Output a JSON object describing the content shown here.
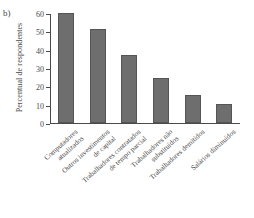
{
  "figure": {
    "panel_label": "b)"
  },
  "chart_data": {
    "type": "bar",
    "title": "",
    "xlabel": "",
    "ylabel": "Percentual de respondentes",
    "ylim": [
      0,
      60
    ],
    "yticks": [
      0,
      10,
      20,
      30,
      40,
      50,
      60
    ],
    "ytick_labels": [
      "0",
      "10",
      "20",
      "30",
      "40",
      "50",
      "60"
    ],
    "grid": false,
    "legend": null,
    "bar_color": "#6e6e6e",
    "bar_edge_color": "#555555",
    "axis_color": "#4a4a4a",
    "categories": [
      "Computadores atualizados",
      "Outros investimentos de capital",
      "Trabalhadores contratados de tempo parcial",
      "Trabalhadores não substituídos",
      "Trabalhadores demitidos",
      "Salários diminuídos"
    ],
    "category_lines": [
      [
        "Computadores",
        "atualizados"
      ],
      [
        "Outros investimentos",
        "de capital"
      ],
      [
        "Trabalhadores contratados",
        "de tempo parcial"
      ],
      [
        "Trabalhadores não",
        "substituídos"
      ],
      [
        "Trabalhadores demitidos"
      ],
      [
        "Salários diminuídos"
      ]
    ],
    "values": [
      60,
      51.5,
      37,
      24.5,
      15.5,
      10.5
    ]
  }
}
